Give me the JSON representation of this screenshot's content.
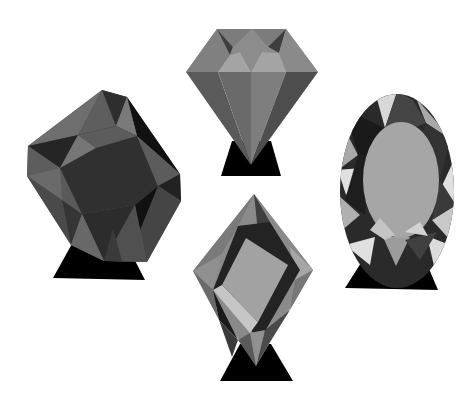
{
  "scene": {
    "background": "#ffffff",
    "description": "Four faceted grayscale gemstones on black triangular stands",
    "gems": [
      {
        "id": "cushion",
        "label": "cushion-cut gem",
        "position": "left"
      },
      {
        "id": "heart",
        "label": "shield/diamond-cut gem",
        "position": "top-center"
      },
      {
        "id": "oval",
        "label": "oval-cut gem",
        "position": "right"
      },
      {
        "id": "kite",
        "label": "kite/lozenge-cut gem",
        "position": "bottom-center"
      }
    ]
  },
  "colors": {
    "stand": "#000000",
    "dark": "#2a2a2a",
    "darker": "#111111",
    "mid": "#6a6a6a",
    "midlight": "#858585",
    "light": "#a8a8a8",
    "lighter": "#c8c8c8",
    "highlight": "#e0e0e0"
  }
}
